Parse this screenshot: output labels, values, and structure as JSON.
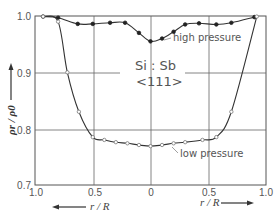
{
  "chart_data": {
    "type": "line",
    "title": "",
    "annotation_main": "Si : Sb",
    "annotation_orientation": "<111>",
    "xlabel_left": "r / R",
    "xlabel_right": "r / R",
    "ylabel": "ρr / ρ0",
    "xlim": [
      -1.0,
      1.0
    ],
    "ylim": [
      0.7,
      1.0
    ],
    "x_tick_labels": [
      "1.0",
      "0.5",
      "0",
      "0.5",
      "1.0"
    ],
    "x_tick_values": [
      -1.0,
      -0.5,
      0,
      0.5,
      1.0
    ],
    "y_tick_labels": [
      "0.7",
      "0.8",
      "0.9",
      "1.0"
    ],
    "y_tick_values": [
      0.7,
      0.8,
      0.9,
      1.0
    ],
    "grid": true,
    "legend": "none (inline curve labels)",
    "series": [
      {
        "name": "high pressure",
        "marker": "filled-circle",
        "x": [
          -0.93,
          -0.8,
          -0.63,
          -0.5,
          -0.35,
          -0.22,
          -0.1,
          0.0,
          0.1,
          0.2,
          0.3,
          0.42,
          0.57,
          0.7,
          0.9
        ],
        "y": [
          0.999,
          0.997,
          0.986,
          0.986,
          0.988,
          0.988,
          0.97,
          0.955,
          0.96,
          0.972,
          0.985,
          0.987,
          0.985,
          0.988,
          0.998
        ]
      },
      {
        "name": "low pressure",
        "marker": "open-circle",
        "x": [
          -0.93,
          -0.8,
          -0.72,
          -0.62,
          -0.5,
          -0.4,
          -0.3,
          -0.2,
          -0.1,
          0.0,
          0.1,
          0.2,
          0.3,
          0.45,
          0.57,
          0.7,
          0.92
        ],
        "y": [
          0.999,
          0.99,
          0.9,
          0.83,
          0.785,
          0.78,
          0.776,
          0.774,
          0.771,
          0.769,
          0.771,
          0.774,
          0.776,
          0.78,
          0.785,
          0.83,
          0.999
        ]
      }
    ]
  },
  "labels": {
    "high_pressure": "high pressure",
    "low_pressure": "low pressure",
    "material": "Si : Sb",
    "orientation": "<111>",
    "ylabel": "ρr / ρ0",
    "xlabel_left": "r / R",
    "xlabel_right": "r / R",
    "ticks_x": [
      "1.0",
      "0.5",
      "0",
      "0.5",
      "1.0"
    ],
    "ticks_y": [
      "1.0",
      "0.9",
      "0.8",
      "0.7"
    ]
  }
}
